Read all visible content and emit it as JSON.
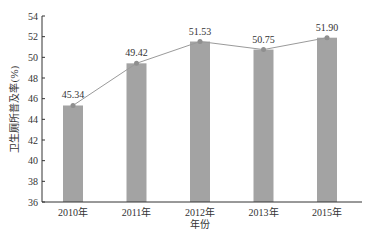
{
  "chart_data": {
    "type": "bar",
    "overlay": "line",
    "title": "",
    "xlabel": "年份",
    "ylabel": "卫生厕所普及率(%)",
    "categories": [
      "2010年",
      "2011年",
      "2012年",
      "2013年",
      "2015年"
    ],
    "values": [
      45.34,
      49.42,
      51.53,
      50.75,
      51.9
    ],
    "data_labels": [
      "45.34",
      "49.42",
      "51.53",
      "50.75",
      "51.90"
    ],
    "ylim": [
      36,
      54
    ],
    "yticks": [
      36,
      38,
      40,
      42,
      44,
      46,
      48,
      50,
      52,
      54
    ],
    "grid": false,
    "legend": null,
    "colors": {
      "bar": "#a3a3a3",
      "line": "#9a9a9a",
      "marker": "#8f8f8f",
      "axis": "#333333"
    }
  }
}
